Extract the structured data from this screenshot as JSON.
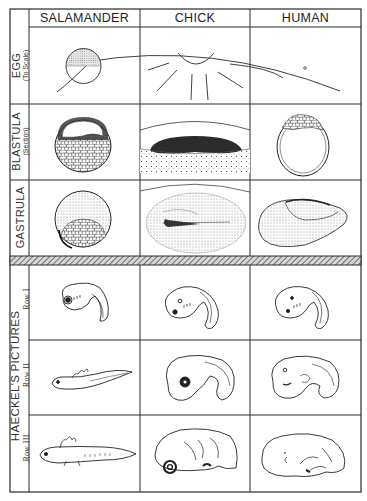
{
  "columns": [
    {
      "label": "SALAMANDER"
    },
    {
      "label": "CHICK"
    },
    {
      "label": "HUMAN"
    }
  ],
  "rows": {
    "egg": {
      "label": "EGG",
      "sublabel": "(To Scale)"
    },
    "blastula": {
      "label": "BLASTULA",
      "sublabel": "(Section)"
    },
    "gastrula": {
      "label": "GASTRULA"
    },
    "haeckel": {
      "group_label": "HAECKEL'S PICTURES",
      "rows": [
        {
          "label": "Row I"
        },
        {
          "label": "Row II"
        },
        {
          "label": "Row III"
        }
      ]
    }
  },
  "colors": {
    "ink": "#1e1e1e",
    "grid": "#2a2a2a",
    "stipple": "#9a9a9a",
    "hatch": "#555555",
    "paper": "#ffffff"
  }
}
